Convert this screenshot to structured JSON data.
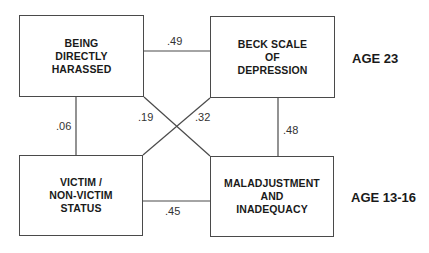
{
  "nodes": {
    "top_left": {
      "label": "BEING\nDIRECTLY\nHARASSED"
    },
    "top_right": {
      "label": "BECK SCALE\nOF\nDEPRESSION"
    },
    "bottom_left": {
      "label": "VICTIM /\nNON-VICTIM\nSTATUS"
    },
    "bottom_right": {
      "label": "MALADJUSTMENT\nAND\nINADEQUACY"
    }
  },
  "edges": {
    "top": {
      "from": "top_left",
      "to": "top_right",
      "value": ".49"
    },
    "bottom": {
      "from": "bottom_left",
      "to": "bottom_right",
      "value": ".45"
    },
    "left": {
      "from": "top_left",
      "to": "bottom_left",
      "value": ".06"
    },
    "right": {
      "from": "top_right",
      "to": "bottom_right",
      "value": ".48"
    },
    "diag_tl_br": {
      "from": "top_left",
      "to": "bottom_right",
      "value": ".19"
    },
    "diag_tr_bl": {
      "from": "top_right",
      "to": "bottom_left",
      "value": ".32"
    }
  },
  "age_labels": {
    "top": "AGE 23",
    "bottom": "AGE 13-16"
  }
}
